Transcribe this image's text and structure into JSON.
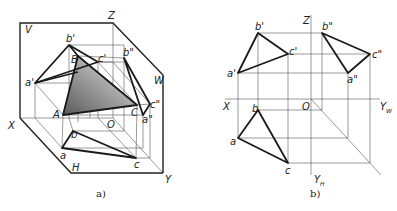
{
  "figure_a": {
    "caption": "a)",
    "plane_labels": {
      "V": "V",
      "W": "W",
      "H": "H"
    },
    "axis_labels": {
      "X": "X",
      "Y": "Y",
      "Z": "Z",
      "O": "O"
    },
    "space_points": {
      "A": "A",
      "B": "B",
      "C": "C"
    },
    "front_view": {
      "a": "a'",
      "b": "b'",
      "c": "c'"
    },
    "side_view": {
      "a": "a\"",
      "b": "b\"",
      "c": "c\""
    },
    "top_view": {
      "a": "a",
      "b": "b",
      "c": "c"
    },
    "colors": {
      "triangle_fill_dark": "#6e6e6e",
      "triangle_fill_light": "#e8e8e8",
      "line": "#1a1a1a"
    }
  },
  "figure_b": {
    "caption": "b)",
    "axis_labels": {
      "X": "X",
      "Z": "Z",
      "O": "O",
      "YW": "Y",
      "YW_sub": "W",
      "YH": "Y",
      "YH_sub": "H"
    },
    "front_view": {
      "a": "a'",
      "b": "b'",
      "c": "c'"
    },
    "side_view": {
      "a": "a\"",
      "b": "b\"",
      "c": "c\""
    },
    "top_view": {
      "a": "a",
      "b": "b",
      "c": "c"
    }
  }
}
